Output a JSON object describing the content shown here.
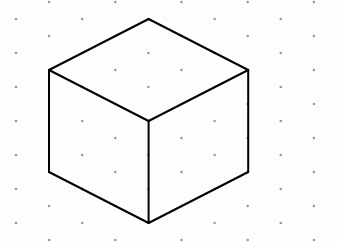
{
  "colors": {
    "background": "#fdfdfd",
    "dot": "#9a9a9a",
    "edge": "#000000"
  },
  "grid": {
    "type": "isometric-dots"
  },
  "shape": {
    "name": "cube",
    "vertices": {
      "top": [
        3,
        0
      ],
      "upper_left": [
        0,
        3
      ],
      "upper_right": [
        6,
        3
      ],
      "front_center": [
        3,
        6
      ],
      "lower_left": [
        0,
        9
      ],
      "lower_right": [
        6,
        9
      ],
      "bottom": [
        3,
        12
      ]
    },
    "edges": [
      [
        "top",
        "upper_left"
      ],
      [
        "top",
        "upper_right"
      ],
      [
        "upper_left",
        "front_center"
      ],
      [
        "upper_right",
        "front_center"
      ],
      [
        "upper_left",
        "lower_left"
      ],
      [
        "front_center",
        "bottom"
      ],
      [
        "upper_right",
        "lower_right"
      ],
      [
        "lower_left",
        "bottom"
      ],
      [
        "lower_right",
        "bottom"
      ]
    ]
  }
}
